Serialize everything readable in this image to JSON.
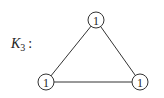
{
  "graph": {
    "name_main": "K",
    "name_sub": "3",
    "name_suffix": ":",
    "nodes": [
      {
        "id": "top",
        "label": "1",
        "x": 96,
        "y": 20
      },
      {
        "id": "bottom-left",
        "label": "1",
        "x": 46,
        "y": 82
      },
      {
        "id": "bottom-right",
        "label": "1",
        "x": 140,
        "y": 82
      }
    ],
    "edges": [
      [
        "top",
        "bottom-left"
      ],
      [
        "top",
        "bottom-right"
      ],
      [
        "bottom-left",
        "bottom-right"
      ]
    ]
  }
}
